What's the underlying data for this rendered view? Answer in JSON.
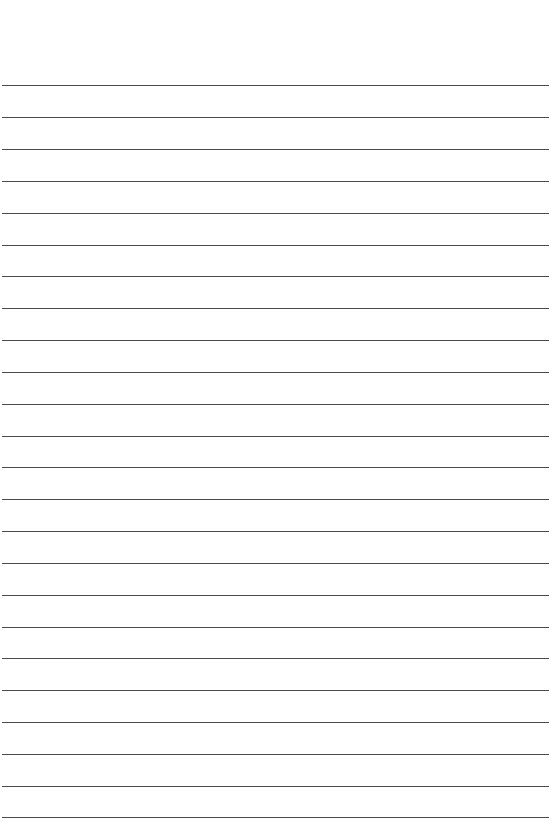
{
  "document": {
    "type": "lined-paper",
    "title": "Blank Ruled Notebook Page",
    "page_width": 553,
    "page_height": 836,
    "background_color": "#ffffff",
    "content_text": "",
    "visible_text_count": 0
  },
  "ruling": {
    "line_color": "#4a4a4a",
    "line_thickness": 1,
    "line_spacing": 31.8,
    "first_line_y": 85,
    "line_count": 24,
    "line_left_x": 2,
    "line_right_x": 549,
    "line_width": 547,
    "top_margin": 85,
    "bottom_margin": 19,
    "left_margin": 2,
    "right_margin": 4,
    "vertical_margin_rule": false,
    "lines_y": [
      85,
      117,
      149,
      181,
      213,
      245,
      276,
      308,
      340,
      372,
      404,
      436,
      467,
      499,
      531,
      563,
      595,
      627,
      658,
      690,
      722,
      754,
      786,
      817
    ]
  }
}
